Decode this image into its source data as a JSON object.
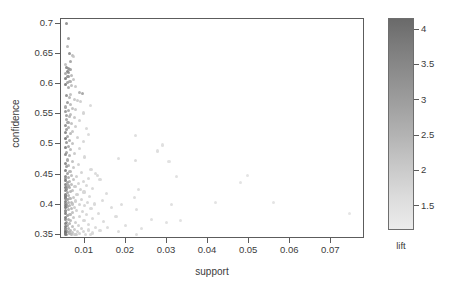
{
  "chart_data": {
    "type": "scatter",
    "title": "",
    "xlabel": "support",
    "ylabel": "confidence",
    "xlim": [
      0.0042,
      0.0782
    ],
    "ylim": [
      0.343,
      0.708
    ],
    "grid": false,
    "legend": {
      "position": "right",
      "title": "lift",
      "type": "colorbar",
      "colormap": "grayscale-dark-high",
      "vmin": 1.15,
      "vmax": 4.15,
      "ticks": [
        4,
        3.5,
        3,
        2.5,
        2,
        1.5
      ],
      "tick_labels": [
        "4",
        "3.5",
        "3",
        "2.5",
        "2",
        "1.5"
      ],
      "color_low": "#ececec",
      "color_high": "#6a6a6a"
    },
    "xticks": [
      0.01,
      0.02,
      0.03,
      0.04,
      0.05,
      0.06,
      0.07
    ],
    "xtick_labels": [
      "0.01",
      "0.02",
      "0.03",
      "0.04",
      "0.05",
      "0.06",
      "0.07"
    ],
    "yticks": [
      0.35,
      0.4,
      0.45,
      0.5,
      0.55,
      0.6,
      0.65,
      0.7
    ],
    "ytick_labels": [
      "0.35",
      "0.4",
      "0.45",
      "0.5",
      "0.55",
      "0.6",
      "0.65",
      "0.7"
    ],
    "point_columns": [
      "support",
      "confidence",
      "lift"
    ],
    "points": [
      [
        0.0055,
        0.701,
        3.55
      ],
      [
        0.006,
        0.676,
        3.25
      ],
      [
        0.0058,
        0.663,
        2.6
      ],
      [
        0.0062,
        0.651,
        3.6
      ],
      [
        0.007,
        0.648,
        2.45
      ],
      [
        0.0073,
        0.646,
        2.1
      ],
      [
        0.0066,
        0.638,
        3.05
      ],
      [
        0.0052,
        0.632,
        2.35
      ],
      [
        0.0056,
        0.628,
        3.7
      ],
      [
        0.006,
        0.626,
        3.4
      ],
      [
        0.0064,
        0.624,
        3.15
      ],
      [
        0.0057,
        0.621,
        3.85
      ],
      [
        0.0061,
        0.619,
        3.3
      ],
      [
        0.0054,
        0.617,
        2.95
      ],
      [
        0.0068,
        0.615,
        2.55
      ],
      [
        0.0059,
        0.612,
        3.45
      ],
      [
        0.0052,
        0.609,
        3.95
      ],
      [
        0.0072,
        0.607,
        2.25
      ],
      [
        0.0064,
        0.605,
        2.85
      ],
      [
        0.0058,
        0.602,
        3.1
      ],
      [
        0.0053,
        0.6,
        4.05
      ],
      [
        0.0068,
        0.598,
        2.4
      ],
      [
        0.0078,
        0.596,
        2.15
      ],
      [
        0.006,
        0.594,
        2.95
      ],
      [
        0.0086,
        0.586,
        2.75
      ],
      [
        0.0095,
        0.585,
        3.05
      ],
      [
        0.0066,
        0.583,
        2.35
      ],
      [
        0.0056,
        0.581,
        3.5
      ],
      [
        0.0062,
        0.578,
        2.6
      ],
      [
        0.0074,
        0.575,
        2.2
      ],
      [
        0.0082,
        0.573,
        2.05
      ],
      [
        0.009,
        0.571,
        1.95
      ],
      [
        0.0058,
        0.569,
        3.25
      ],
      [
        0.0065,
        0.566,
        2.5
      ],
      [
        0.0113,
        0.564,
        1.7
      ],
      [
        0.0054,
        0.562,
        3.0
      ],
      [
        0.0071,
        0.56,
        2.3
      ],
      [
        0.0078,
        0.558,
        2.1
      ],
      [
        0.006,
        0.556,
        2.8
      ],
      [
        0.0052,
        0.554,
        3.35
      ],
      [
        0.0096,
        0.552,
        1.85
      ],
      [
        0.0066,
        0.55,
        2.45
      ],
      [
        0.0056,
        0.548,
        3.15
      ],
      [
        0.0063,
        0.546,
        2.65
      ],
      [
        0.0074,
        0.544,
        2.2
      ],
      [
        0.0055,
        0.541,
        2.9
      ],
      [
        0.0086,
        0.539,
        1.9
      ],
      [
        0.0059,
        0.537,
        3.05
      ],
      [
        0.0068,
        0.534,
        2.35
      ],
      [
        0.0052,
        0.532,
        3.6
      ],
      [
        0.0078,
        0.53,
        2.0
      ],
      [
        0.0061,
        0.528,
        2.7
      ],
      [
        0.0104,
        0.526,
        1.75
      ],
      [
        0.0056,
        0.524,
        3.2
      ],
      [
        0.0071,
        0.522,
        2.25
      ],
      [
        0.0053,
        0.52,
        3.8
      ],
      [
        0.0065,
        0.518,
        2.55
      ],
      [
        0.011,
        0.516,
        1.65
      ],
      [
        0.0224,
        0.515,
        1.6
      ],
      [
        0.0058,
        0.513,
        3.0
      ],
      [
        0.0082,
        0.511,
        1.95
      ],
      [
        0.0052,
        0.509,
        4.1
      ],
      [
        0.0062,
        0.507,
        2.75
      ],
      [
        0.0096,
        0.505,
        1.8
      ],
      [
        0.0055,
        0.503,
        3.4
      ],
      [
        0.007,
        0.501,
        2.3
      ],
      [
        0.0288,
        0.499,
        1.55
      ],
      [
        0.006,
        0.497,
        2.85
      ],
      [
        0.0052,
        0.495,
        3.95
      ],
      [
        0.0088,
        0.493,
        1.88
      ],
      [
        0.0066,
        0.491,
        2.5
      ],
      [
        0.0276,
        0.489,
        1.58
      ],
      [
        0.0056,
        0.487,
        3.1
      ],
      [
        0.0075,
        0.485,
        2.1
      ],
      [
        0.0053,
        0.483,
        3.65
      ],
      [
        0.0063,
        0.481,
        2.65
      ],
      [
        0.01,
        0.479,
        1.78
      ],
      [
        0.0181,
        0.476,
        1.62
      ],
      [
        0.0058,
        0.474,
        2.95
      ],
      [
        0.0224,
        0.473,
        1.66
      ],
      [
        0.0069,
        0.471,
        2.35
      ],
      [
        0.0052,
        0.469,
        3.85
      ],
      [
        0.0084,
        0.467,
        1.92
      ],
      [
        0.0061,
        0.465,
        2.7
      ],
      [
        0.0055,
        0.463,
        3.3
      ],
      [
        0.0305,
        0.471,
        1.5
      ],
      [
        0.0073,
        0.461,
        2.2
      ],
      [
        0.0115,
        0.459,
        1.72
      ],
      [
        0.0052,
        0.457,
        4.0
      ],
      [
        0.0064,
        0.455,
        2.6
      ],
      [
        0.0091,
        0.453,
        1.85
      ],
      [
        0.0057,
        0.452,
        3.15
      ],
      [
        0.0126,
        0.451,
        1.68
      ],
      [
        0.0131,
        0.449,
        1.7
      ],
      [
        0.0068,
        0.448,
        2.42
      ],
      [
        0.0052,
        0.447,
        3.75
      ],
      [
        0.0079,
        0.446,
        1.98
      ],
      [
        0.006,
        0.445,
        2.8
      ],
      [
        0.0495,
        0.448,
        1.45
      ],
      [
        0.011,
        0.444,
        1.74
      ],
      [
        0.0054,
        0.443,
        3.35
      ],
      [
        0.0137,
        0.442,
        1.66
      ],
      [
        0.0072,
        0.441,
        2.25
      ],
      [
        0.0478,
        0.436,
        1.48
      ],
      [
        0.0052,
        0.44,
        4.05
      ],
      [
        0.0063,
        0.439,
        2.65
      ],
      [
        0.0323,
        0.447,
        1.52
      ],
      [
        0.0097,
        0.438,
        1.82
      ],
      [
        0.0057,
        0.437,
        3.05
      ],
      [
        0.0085,
        0.435,
        1.9
      ],
      [
        0.0052,
        0.434,
        3.9
      ],
      [
        0.0067,
        0.433,
        2.45
      ],
      [
        0.0104,
        0.432,
        1.76
      ],
      [
        0.0059,
        0.431,
        2.88
      ],
      [
        0.0076,
        0.43,
        2.08
      ],
      [
        0.0052,
        0.429,
        4.12
      ],
      [
        0.0062,
        0.428,
        2.72
      ],
      [
        0.0119,
        0.427,
        1.7
      ],
      [
        0.0055,
        0.426,
        3.25
      ],
      [
        0.0089,
        0.425,
        1.88
      ],
      [
        0.023,
        0.425,
        1.6
      ],
      [
        0.007,
        0.424,
        2.3
      ],
      [
        0.0052,
        0.423,
        3.7
      ],
      [
        0.0065,
        0.422,
        2.58
      ],
      [
        0.0098,
        0.421,
        1.8
      ],
      [
        0.0058,
        0.42,
        3.0
      ],
      [
        0.0152,
        0.418,
        1.65
      ],
      [
        0.0081,
        0.417,
        1.96
      ],
      [
        0.0052,
        0.416,
        4.08
      ],
      [
        0.0061,
        0.415,
        2.76
      ],
      [
        0.0112,
        0.414,
        1.72
      ],
      [
        0.0054,
        0.413,
        3.38
      ],
      [
        0.0073,
        0.412,
        2.22
      ],
      [
        0.0221,
        0.412,
        1.62
      ],
      [
        0.0052,
        0.411,
        3.82
      ],
      [
        0.0064,
        0.41,
        2.62
      ],
      [
        0.0092,
        0.409,
        1.86
      ],
      [
        0.0057,
        0.408,
        3.12
      ],
      [
        0.0142,
        0.407,
        1.68
      ],
      [
        0.0078,
        0.406,
        1.99
      ],
      [
        0.0052,
        0.405,
        4.0
      ],
      [
        0.0068,
        0.404,
        2.4
      ],
      [
        0.0106,
        0.403,
        1.77
      ],
      [
        0.006,
        0.403,
        2.84
      ],
      [
        0.0419,
        0.403,
        1.47
      ],
      [
        0.0559,
        0.403,
        1.44
      ],
      [
        0.0052,
        0.402,
        3.66
      ],
      [
        0.0071,
        0.401,
        2.28
      ],
      [
        0.0124,
        0.401,
        1.7
      ],
      [
        0.0055,
        0.4,
        3.28
      ],
      [
        0.0086,
        0.4,
        1.9
      ],
      [
        0.031,
        0.4,
        1.54
      ],
      [
        0.019,
        0.4,
        1.63
      ],
      [
        0.0052,
        0.399,
        3.92
      ],
      [
        0.0063,
        0.398,
        2.68
      ],
      [
        0.01,
        0.398,
        1.79
      ],
      [
        0.0058,
        0.397,
        3.02
      ],
      [
        0.0165,
        0.396,
        1.66
      ],
      [
        0.0075,
        0.396,
        2.06
      ],
      [
        0.0052,
        0.395,
        4.1
      ],
      [
        0.0067,
        0.394,
        2.48
      ],
      [
        0.0115,
        0.393,
        1.73
      ],
      [
        0.0061,
        0.392,
        2.78
      ],
      [
        0.0226,
        0.392,
        1.58
      ],
      [
        0.0052,
        0.391,
        3.74
      ],
      [
        0.008,
        0.39,
        1.94
      ],
      [
        0.0095,
        0.389,
        1.84
      ],
      [
        0.0054,
        0.388,
        3.3
      ],
      [
        0.007,
        0.387,
        2.32
      ],
      [
        0.0133,
        0.386,
        1.69
      ],
      [
        0.0744,
        0.385,
        1.4
      ],
      [
        0.0052,
        0.385,
        3.96
      ],
      [
        0.0064,
        0.384,
        2.6
      ],
      [
        0.0104,
        0.383,
        1.76
      ],
      [
        0.0057,
        0.382,
        3.08
      ],
      [
        0.0088,
        0.381,
        1.88
      ],
      [
        0.0176,
        0.38,
        1.64
      ],
      [
        0.0052,
        0.379,
        4.06
      ],
      [
        0.0073,
        0.378,
        2.18
      ],
      [
        0.0118,
        0.377,
        1.71
      ],
      [
        0.006,
        0.376,
        2.82
      ],
      [
        0.0262,
        0.376,
        1.56
      ],
      [
        0.0052,
        0.375,
        3.68
      ],
      [
        0.0066,
        0.374,
        2.52
      ],
      [
        0.0098,
        0.373,
        1.8
      ],
      [
        0.0145,
        0.372,
        1.67
      ],
      [
        0.0055,
        0.371,
        3.22
      ],
      [
        0.0333,
        0.373,
        1.5
      ],
      [
        0.0078,
        0.37,
        2.0
      ],
      [
        0.0298,
        0.37,
        1.52
      ],
      [
        0.0052,
        0.369,
        3.88
      ],
      [
        0.0062,
        0.368,
        2.7
      ],
      [
        0.011,
        0.367,
        1.74
      ],
      [
        0.0058,
        0.366,
        2.98
      ],
      [
        0.02,
        0.366,
        1.61
      ],
      [
        0.0084,
        0.365,
        1.92
      ],
      [
        0.0052,
        0.364,
        4.02
      ],
      [
        0.0069,
        0.363,
        2.38
      ],
      [
        0.0126,
        0.362,
        1.7
      ],
      [
        0.0155,
        0.362,
        1.65
      ],
      [
        0.0061,
        0.361,
        2.74
      ],
      [
        0.0052,
        0.36,
        3.78
      ],
      [
        0.0092,
        0.36,
        1.86
      ],
      [
        0.0239,
        0.36,
        1.57
      ],
      [
        0.0074,
        0.359,
        2.12
      ],
      [
        0.0054,
        0.358,
        3.32
      ],
      [
        0.0108,
        0.358,
        1.75
      ],
      [
        0.0137,
        0.357,
        1.68
      ],
      [
        0.0065,
        0.357,
        2.56
      ],
      [
        0.0052,
        0.356,
        3.94
      ],
      [
        0.0082,
        0.356,
        1.93
      ],
      [
        0.0181,
        0.356,
        1.63
      ],
      [
        0.0058,
        0.355,
        3.06
      ],
      [
        0.0097,
        0.355,
        1.82
      ],
      [
        0.007,
        0.354,
        2.26
      ],
      [
        0.0052,
        0.354,
        4.14
      ],
      [
        0.0119,
        0.353,
        1.72
      ],
      [
        0.0063,
        0.353,
        2.66
      ],
      [
        0.0088,
        0.352,
        1.89
      ],
      [
        0.0052,
        0.352,
        3.72
      ],
      [
        0.0076,
        0.351,
        2.04
      ],
      [
        0.0101,
        0.351,
        1.78
      ],
      [
        0.0056,
        0.351,
        3.18
      ],
      [
        0.0067,
        0.35,
        2.44
      ],
      [
        0.0225,
        0.35,
        1.59
      ],
      [
        0.0114,
        0.35,
        1.73
      ],
      [
        0.0052,
        0.35,
        3.86
      ],
      [
        0.008,
        0.35,
        1.95
      ]
    ]
  }
}
